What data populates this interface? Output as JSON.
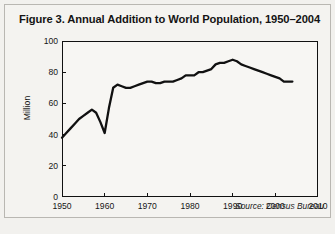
{
  "figure": {
    "title": "Figure 3. Annual Addition to World Population, 1950–2004",
    "source_note": "Source: Census Bureau",
    "border_color": "#b9b7b2",
    "page_background": "#f2f1ee",
    "plot_background": "#f7f6f3",
    "line_color": "#111111"
  },
  "chart_data": {
    "type": "line",
    "title": "Figure 3. Annual Addition to World Population, 1950–2004",
    "xlabel": "",
    "ylabel": "Million",
    "xlim": [
      1950,
      2010
    ],
    "ylim": [
      0,
      100
    ],
    "xticks": [
      1950,
      1960,
      1970,
      1980,
      1990,
      2000,
      2010
    ],
    "xtick_labels": [
      "1950",
      "1960",
      "1970",
      "1980",
      "1990",
      "2000",
      "2010"
    ],
    "yticks": [
      0,
      20,
      40,
      60,
      80,
      100
    ],
    "ytick_labels": [
      "0",
      "20",
      "40",
      "60",
      "80",
      "100"
    ],
    "grid": false,
    "legend": null,
    "annotations": [
      {
        "text": "Source: Census Bureau",
        "position": "bottom-right",
        "italic": true
      }
    ],
    "series": [
      {
        "name": "Annual Addition to World Population",
        "units": "Million",
        "x": [
          1950,
          1951,
          1952,
          1953,
          1954,
          1955,
          1956,
          1957,
          1958,
          1959,
          1960,
          1961,
          1962,
          1963,
          1964,
          1965,
          1966,
          1967,
          1968,
          1969,
          1970,
          1971,
          1972,
          1973,
          1974,
          1975,
          1976,
          1977,
          1978,
          1979,
          1980,
          1981,
          1982,
          1983,
          1984,
          1985,
          1986,
          1987,
          1988,
          1989,
          1990,
          1991,
          1992,
          1993,
          1994,
          1995,
          1996,
          1997,
          1998,
          1999,
          2000,
          2001,
          2002,
          2003,
          2004
        ],
        "values": [
          38,
          41,
          44,
          47,
          50,
          52,
          54,
          56,
          54,
          48,
          41,
          57,
          70,
          72,
          71,
          70,
          70,
          71,
          72,
          73,
          74,
          74,
          73,
          73,
          74,
          74,
          74,
          75,
          76,
          78,
          78,
          78,
          80,
          80,
          81,
          82,
          85,
          86,
          86,
          87,
          88,
          87,
          85,
          84,
          83,
          82,
          81,
          80,
          79,
          78,
          77,
          76,
          74,
          74,
          74
        ]
      }
    ]
  }
}
